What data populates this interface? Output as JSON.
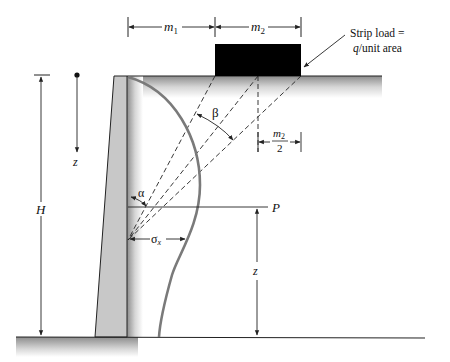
{
  "labels": {
    "m1": "m",
    "m1_sub": "1",
    "m2": "m",
    "m2_sub": "2",
    "half_m2_num": "m",
    "half_m2_num_sub": "2",
    "half_m2_den": "2",
    "strip_load_line1": "Strip load  =",
    "strip_load_q": "q",
    "strip_load_line2": "/unit area",
    "H": "H",
    "z_left": "z",
    "z_right": "z",
    "beta": "β",
    "alpha": "α",
    "sigma": "σ",
    "sigma_sub": "x",
    "P": "P"
  },
  "colors": {
    "wall_fill": "#c8c8c8",
    "load_block": "#000000",
    "pressure_curve": "#7a7a7a",
    "lines": "#222222"
  }
}
